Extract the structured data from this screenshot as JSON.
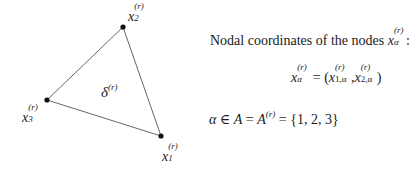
{
  "diagram": {
    "element_label": {
      "base": "δ",
      "superscript": "(r)"
    },
    "nodes": [
      {
        "id": "1",
        "base": "x",
        "superscript": "(r)",
        "subscript": "1",
        "cx": 161,
        "cy": 136
      },
      {
        "id": "2",
        "base": "x",
        "superscript": "(r)",
        "subscript": "2",
        "cx": 123,
        "cy": 27
      },
      {
        "id": "3",
        "base": "x",
        "superscript": "(r)",
        "subscript": "3",
        "cx": 47,
        "cy": 100
      }
    ],
    "colors": {
      "edge": "#555555",
      "node": "#111111",
      "text": "#1a1a1a"
    }
  },
  "text": {
    "nodal_intro": "Nodal coordinates of the nodes",
    "nodal_intro_var": {
      "base": "x",
      "superscript": "(r)",
      "subscript": "α"
    },
    "nodal_intro_colon": ":",
    "formula_coordinates": {
      "lhs_base": "x",
      "lhs_sup": "(r)",
      "lhs_sub": "α",
      "equals": "=",
      "open_paren": "(",
      "term1_base": "x",
      "term1_sup": "(r)",
      "term1_sub": "1,α",
      "comma": ",",
      "term2_base": "x",
      "term2_sup": "(r)",
      "term2_sub": "2,α",
      "close_paren": ")"
    },
    "formula_index_set": {
      "alpha": "α",
      "in": "∈",
      "set_A": "A",
      "equals1": "=",
      "set_A_r_base": "A",
      "set_A_r_sup": "(r)",
      "equals2": "=",
      "set_values": "{1, 2, 3}"
    }
  }
}
